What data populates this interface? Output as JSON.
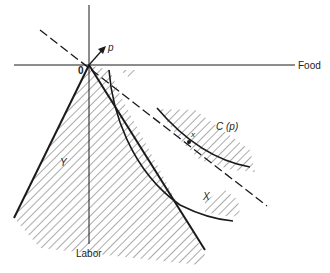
{
  "diagram": {
    "axes": {
      "x_label": "Food",
      "y_label": "Labor",
      "origin_label": "0"
    },
    "labels": {
      "price_vector": "p",
      "production_set": "Y",
      "consumption_set": "X",
      "preferred_set": "C (p)",
      "point": "x"
    },
    "elements": [
      "production set Y (hatched cone)",
      "consumption set X boundary",
      "preferred set C(p) boundary",
      "price hyperplane (dashed)",
      "price vector p arrow"
    ],
    "colors": {
      "line": "#1a1a1a",
      "hatch": "#555555",
      "background": "#ffffff"
    }
  }
}
